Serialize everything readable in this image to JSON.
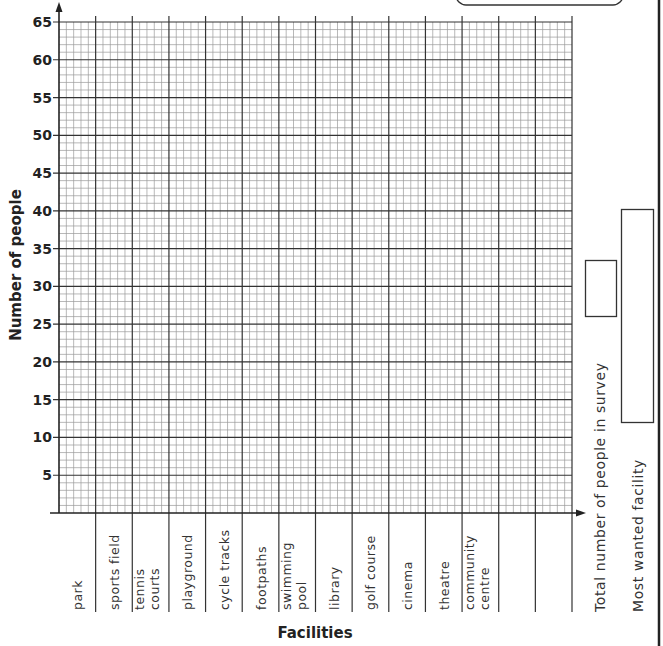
{
  "chart_data": {
    "type": "bar",
    "title": "",
    "xlabel": "Facilities",
    "ylabel": "Number of people",
    "ylim": [
      0,
      65
    ],
    "yticks": [
      5,
      10,
      15,
      20,
      25,
      30,
      35,
      40,
      45,
      50,
      55,
      60,
      65
    ],
    "grid": true,
    "categories": [
      "park",
      "sports field",
      "tennis courts",
      "playground",
      "cycle tracks",
      "footpaths",
      "swimming pool",
      "library",
      "golf course",
      "cinema",
      "theatre",
      "community centre",
      "",
      ""
    ],
    "category_lines": [
      [
        "park"
      ],
      [
        "sports field"
      ],
      [
        "tennis",
        "courts"
      ],
      [
        "playground"
      ],
      [
        "cycle tracks"
      ],
      [
        "footpaths"
      ],
      [
        "swimming",
        "pool"
      ],
      [
        "library"
      ],
      [
        "golf course"
      ],
      [
        "cinema"
      ],
      [
        "theatre"
      ],
      [
        "community",
        "centre"
      ],
      [
        ""
      ],
      [
        ""
      ]
    ],
    "values": [
      null,
      null,
      null,
      null,
      null,
      null,
      null,
      null,
      null,
      null,
      null,
      null,
      null,
      null
    ]
  },
  "side_fields": {
    "total_label": "Total number of people in survey",
    "total_value": "",
    "most_wanted_label": "Most wanted facility",
    "most_wanted_value": ""
  }
}
